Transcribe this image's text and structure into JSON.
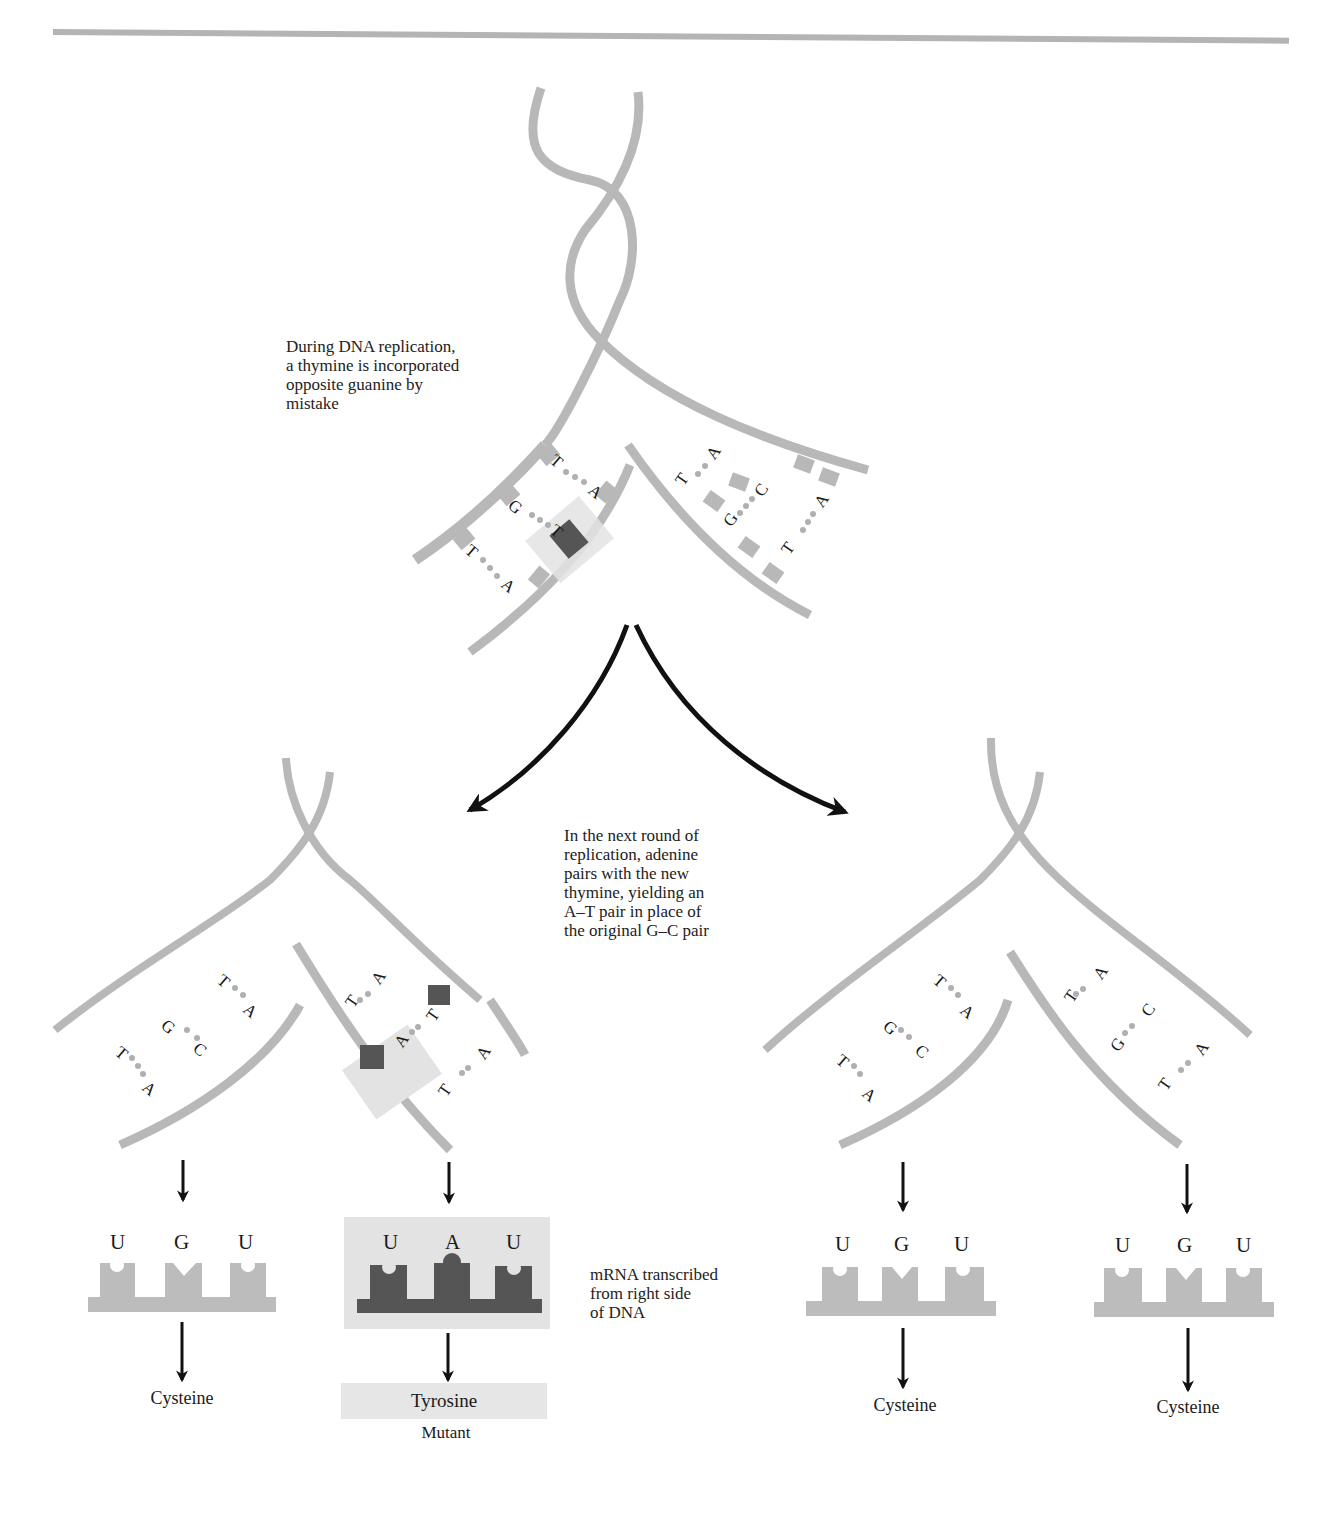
{
  "captions": {
    "replication_error": [
      "During DNA replication,",
      "a thymine is incorporated",
      "opposite guanine by",
      "mistake"
    ],
    "next_round": [
      "In the next round of",
      "replication, adenine",
      "pairs with the new",
      "thymine, yielding an",
      "A–T pair in place of",
      "the original G–C pair"
    ],
    "mrna": [
      "mRNA transcribed",
      "from right side",
      "of DNA"
    ]
  },
  "top_fork": {
    "left_pairs": [
      {
        "a": "T",
        "b": "A"
      },
      {
        "a": "G",
        "b": "T",
        "mismatch": true
      },
      {
        "a": "T",
        "b": "A"
      }
    ],
    "right_pairs": [
      {
        "a": "T",
        "b": "A"
      },
      {
        "a": "G",
        "b": "C"
      },
      {
        "a": "T",
        "b": "A"
      }
    ]
  },
  "bottom_left_fork": {
    "left_pairs": [
      {
        "a": "T",
        "b": "A"
      },
      {
        "a": "G",
        "b": "C"
      },
      {
        "a": "T",
        "b": "A"
      }
    ],
    "right_pairs": [
      {
        "a": "T",
        "b": "A"
      },
      {
        "a": "A",
        "b": "T",
        "mutant": true
      },
      {
        "a": "T",
        "b": "A"
      }
    ]
  },
  "bottom_right_fork": {
    "left_pairs": [
      {
        "a": "T",
        "b": "A"
      },
      {
        "a": "G",
        "b": "C"
      },
      {
        "a": "T",
        "b": "A"
      }
    ],
    "right_pairs": [
      {
        "a": "T",
        "b": "A"
      },
      {
        "a": "G",
        "b": "C"
      },
      {
        "a": "T",
        "b": "A"
      }
    ]
  },
  "codons": [
    {
      "bases": [
        "U",
        "G",
        "U"
      ],
      "amino_acid": "Cysteine",
      "mutant": false
    },
    {
      "bases": [
        "U",
        "A",
        "U"
      ],
      "amino_acid": "Tyrosine",
      "mutant": true,
      "mutant_label": "Mutant"
    },
    {
      "bases": [
        "U",
        "G",
        "U"
      ],
      "amino_acid": "Cysteine",
      "mutant": false
    },
    {
      "bases": [
        "U",
        "G",
        "U"
      ],
      "amino_acid": "Cysteine",
      "mutant": false
    }
  ],
  "colors": {
    "strand": "#b8b8b8",
    "mutant_dark": "#555555",
    "highlight": "#e3e3e3",
    "dot": "#b0b0b0",
    "arrow": "#111111"
  }
}
